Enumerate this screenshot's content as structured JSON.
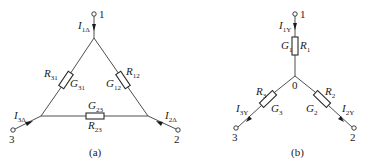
{
  "delta": {
    "caption": "(a)",
    "terminals": {
      "t1": "1",
      "t2": "2",
      "t3": "3"
    },
    "currents": {
      "i1": {
        "main": "I",
        "sub": "1Δ"
      },
      "i2": {
        "main": "I",
        "sub": "2Δ"
      },
      "i3": {
        "main": "I",
        "sub": "3Δ"
      }
    },
    "resistors": {
      "r12": {
        "r_main": "R",
        "r_sub": "12",
        "g_main": "G",
        "g_sub": "12"
      },
      "r23": {
        "r_main": "R",
        "r_sub": "23",
        "g_main": "G",
        "g_sub": "23"
      },
      "r31": {
        "r_main": "R",
        "r_sub": "31",
        "g_main": "G",
        "g_sub": "31"
      }
    }
  },
  "wye": {
    "caption": "(b)",
    "center_label": "0",
    "terminals": {
      "t1": "1",
      "t2": "2",
      "t3": "3"
    },
    "currents": {
      "i1": {
        "main": "I",
        "sub": "1Y"
      },
      "i2": {
        "main": "I",
        "sub": "2Y"
      },
      "i3": {
        "main": "I",
        "sub": "3Y"
      }
    },
    "resistors": {
      "r1": {
        "r_main": "R",
        "r_sub": "1",
        "g_main": "G",
        "g_sub": "1"
      },
      "r2": {
        "r_main": "R",
        "r_sub": "2",
        "g_main": "G",
        "g_sub": "2"
      },
      "r3": {
        "r_main": "R",
        "r_sub": "3",
        "g_main": "G",
        "g_sub": "3"
      }
    }
  }
}
